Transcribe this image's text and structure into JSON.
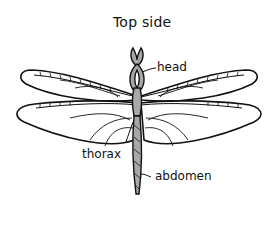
{
  "diagram": {
    "title": "Top side",
    "labels": {
      "head": "head",
      "thorax": "thorax",
      "abdomen": "abdomen"
    },
    "colors": {
      "outline": "#111111",
      "body_fill": "#a8a8a8",
      "wing_fill": "#ffffff",
      "background": "#ffffff"
    }
  }
}
